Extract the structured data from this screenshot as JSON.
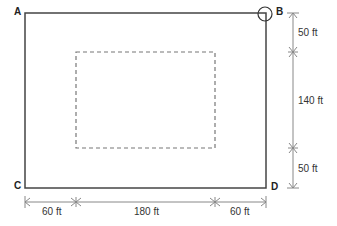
{
  "diagram": {
    "corners": {
      "a": "A",
      "b": "B",
      "c": "C",
      "d": "D"
    },
    "vertical_dims": [
      "50 ft",
      "140 ft",
      "50 ft"
    ],
    "horizontal_dims": [
      "60 ft",
      "180 ft",
      "60 ft"
    ],
    "colors": {
      "outer": "#444444",
      "dashed": "#777777",
      "dim": "#888888"
    }
  }
}
